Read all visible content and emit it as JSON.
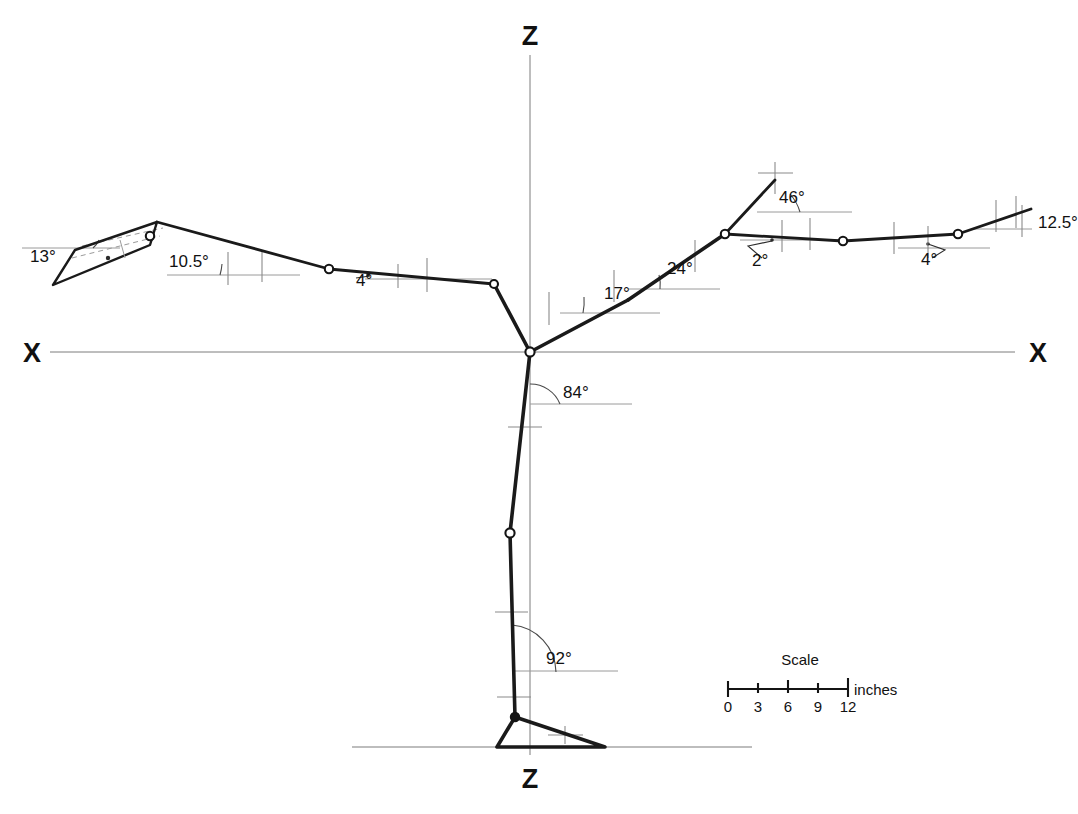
{
  "figure": {
    "background_color": "#ffffff",
    "line_color": "#1a1a1a",
    "reference_color": "#9a9a9a"
  },
  "axes": {
    "vertical_top_label": "Z",
    "vertical_bottom_label": "Z",
    "horizontal_left_label": "X",
    "horizontal_right_label": "X",
    "origin_x": 530,
    "origin_y": 352
  },
  "scale_bar": {
    "title": "Scale",
    "unit_label": "inches",
    "ticks": [
      "0",
      "3",
      "6",
      "9",
      "12"
    ],
    "tick_values": [
      0,
      3,
      6,
      9,
      12
    ]
  },
  "angles": [
    {
      "id": "hand-left-pitch",
      "label": "13°",
      "x": 30,
      "y": 262,
      "description": "left hand plate inclination"
    },
    {
      "id": "forearm-left",
      "label": "10.5°",
      "x": 169,
      "y": 267,
      "description": "left forearm to horizontal"
    },
    {
      "id": "upperarm-left",
      "label": "4°",
      "x": 356,
      "y": 286,
      "description": "left upper arm to horizontal"
    },
    {
      "id": "thigh-to-trunk",
      "label": "17°",
      "x": 604,
      "y": 299,
      "description": "trunk lower segment to horizontal"
    },
    {
      "id": "trunk-mid",
      "label": "24°",
      "x": 667,
      "y": 274,
      "description": "trunk mid segment to horizontal"
    },
    {
      "id": "neck-head",
      "label": "46°",
      "x": 779,
      "y": 203,
      "description": "neck / head axis to horizontal"
    },
    {
      "id": "shoulder-arm",
      "label": "2°",
      "x": 752,
      "y": 266,
      "description": "right upper arm to horizontal"
    },
    {
      "id": "forearm-right",
      "label": "4°",
      "x": 921,
      "y": 265,
      "description": "right forearm to horizontal"
    },
    {
      "id": "hand-right",
      "label": "12.5°",
      "x": 1038,
      "y": 228,
      "description": "right hand to horizontal"
    },
    {
      "id": "hip-thigh",
      "label": "84°",
      "x": 563,
      "y": 398,
      "description": "thigh to vertical at hip"
    },
    {
      "id": "knee-shank",
      "label": "92°",
      "x": 546,
      "y": 664,
      "description": "shank to vertical at knee"
    }
  ],
  "joints": [
    {
      "name": "hand-left-tip",
      "x": 157,
      "y": 222,
      "style": "open"
    },
    {
      "name": "elbow-left",
      "x": 329,
      "y": 269,
      "style": "open"
    },
    {
      "name": "shoulder-left",
      "x": 494,
      "y": 284,
      "style": "open"
    },
    {
      "name": "hip",
      "x": 530,
      "y": 352,
      "style": "open"
    },
    {
      "name": "shoulder-right",
      "x": 725,
      "y": 234,
      "style": "open"
    },
    {
      "name": "elbow-right",
      "x": 843,
      "y": 241,
      "style": "open"
    },
    {
      "name": "wrist-right",
      "x": 958,
      "y": 234,
      "style": "open"
    },
    {
      "name": "knee",
      "x": 510,
      "y": 533,
      "style": "open"
    },
    {
      "name": "ankle",
      "x": 515,
      "y": 717,
      "style": "solid"
    }
  ],
  "segments": [
    {
      "name": "left-forearm",
      "from": [
        157,
        222
      ],
      "to": [
        329,
        269
      ]
    },
    {
      "name": "left-upperarm",
      "from": [
        329,
        269
      ],
      "to": [
        494,
        284
      ]
    },
    {
      "name": "left-shoulder-link",
      "from": [
        494,
        284
      ],
      "to": [
        530,
        352
      ]
    },
    {
      "name": "trunk-lower",
      "from": [
        530,
        352
      ],
      "to": [
        628,
        300
      ]
    },
    {
      "name": "trunk-upper",
      "from": [
        628,
        300
      ],
      "to": [
        725,
        234
      ]
    },
    {
      "name": "neck-head",
      "from": [
        725,
        234
      ],
      "to": [
        775,
        180
      ]
    },
    {
      "name": "right-upperarm",
      "from": [
        725,
        234
      ],
      "to": [
        843,
        241
      ]
    },
    {
      "name": "right-forearm",
      "from": [
        843,
        241
      ],
      "to": [
        958,
        234
      ]
    },
    {
      "name": "right-hand",
      "from": [
        958,
        234
      ],
      "to": [
        1031,
        209
      ]
    },
    {
      "name": "thigh",
      "from": [
        530,
        352
      ],
      "to": [
        510,
        533
      ]
    },
    {
      "name": "shank",
      "from": [
        510,
        533
      ],
      "to": [
        515,
        717
      ]
    },
    {
      "name": "foot-heel",
      "from": [
        515,
        717
      ],
      "to": [
        497,
        747
      ]
    },
    {
      "name": "foot-sole",
      "from": [
        497,
        747
      ],
      "to": [
        605,
        747
      ]
    },
    {
      "name": "foot-toe",
      "from": [
        605,
        747
      ],
      "to": [
        515,
        717
      ]
    }
  ],
  "hand_plate": {
    "name": "left-hand-plate",
    "points": "157,222 150,245 53,285 75,250"
  }
}
